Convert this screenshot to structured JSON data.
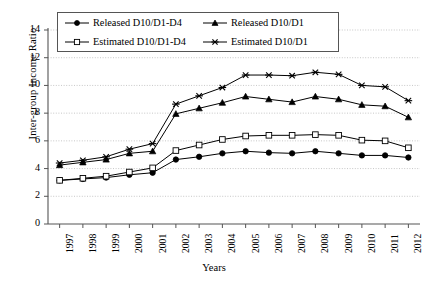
{
  "chart_data": {
    "type": "line",
    "title": "",
    "xlabel": "Years",
    "ylabel": "Inter-group Income Ratio",
    "categories": [
      "1997",
      "1998",
      "1999",
      "2000",
      "2001",
      "2002",
      "2003",
      "2004",
      "2005",
      "2006",
      "2007",
      "2008",
      "2009",
      "2010",
      "2011",
      "2012"
    ],
    "ylim": [
      0,
      14
    ],
    "yticks": [
      0,
      2,
      4,
      6,
      8,
      10,
      12,
      14
    ],
    "grid": true,
    "legend_position": "top",
    "series": [
      {
        "name": "Released D10/D1-D4",
        "marker": "filled-circle",
        "color": "#000000",
        "values": [
          3.15,
          3.25,
          3.35,
          3.55,
          3.7,
          4.65,
          4.85,
          5.1,
          5.25,
          5.15,
          5.1,
          5.25,
          5.1,
          4.95,
          4.95,
          4.8
        ]
      },
      {
        "name": "Released D10/D1",
        "marker": "filled-triangle",
        "color": "#000000",
        "values": [
          4.25,
          4.45,
          4.65,
          5.1,
          5.25,
          7.95,
          8.35,
          8.75,
          9.2,
          9.0,
          8.8,
          9.2,
          9.0,
          8.6,
          8.5,
          7.7
        ]
      },
      {
        "name": "Estimated D10/D1-D4",
        "marker": "open-square",
        "color": "#000000",
        "values": [
          3.15,
          3.3,
          3.45,
          3.75,
          4.05,
          5.3,
          5.7,
          6.1,
          6.35,
          6.4,
          6.4,
          6.45,
          6.4,
          6.05,
          6.0,
          5.5
        ]
      },
      {
        "name": "Estimated D10/D1",
        "marker": "asterisk",
        "color": "#000000",
        "values": [
          4.4,
          4.6,
          4.85,
          5.4,
          5.8,
          8.65,
          9.25,
          9.85,
          10.75,
          10.75,
          10.7,
          10.95,
          10.8,
          10.0,
          9.9,
          8.9
        ]
      }
    ]
  },
  "legend": [
    {
      "label": "Released D10/D1-D4",
      "marker": "filled-circle"
    },
    {
      "label": "Released D10/D1",
      "marker": "filled-triangle"
    },
    {
      "label": "Estimated D10/D1-D4",
      "marker": "open-square"
    },
    {
      "label": "Estimated D10/D1",
      "marker": "asterisk"
    }
  ]
}
